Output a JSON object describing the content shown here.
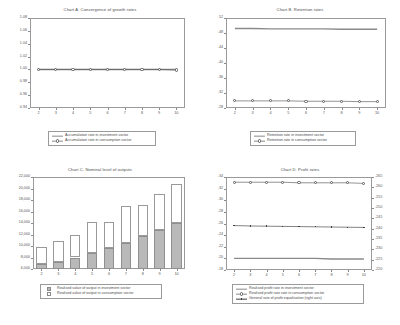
{
  "figure": {
    "panels": [
      "A",
      "B",
      "C",
      "D"
    ]
  },
  "chart_data": [
    {
      "id": "chart-a",
      "type": "line",
      "title": "Chart A. Convergence of growth rates",
      "xlabel": "",
      "ylabel": "",
      "x": [
        2,
        3,
        4,
        5,
        6,
        7,
        8,
        9,
        10
      ],
      "xticklabels": [
        "2",
        "3",
        "4",
        "5",
        "6",
        "7",
        "8",
        "9",
        "10"
      ],
      "ylim": [
        0.94,
        1.08
      ],
      "yticks": [
        1.08,
        1.06,
        1.04,
        1.02,
        1.0,
        0.98,
        0.96,
        0.94
      ],
      "yticklabels": [
        "1.08",
        "1.06",
        "1.04",
        "1.02",
        "1.00",
        "0.98",
        "0.96",
        "0.94"
      ],
      "grid": false,
      "legend_position": "below",
      "series": [
        {
          "name": "Accumulation rate in investment sector",
          "style": "line",
          "color": "#8a8a8a",
          "values": [
            1.0,
            1.0,
            1.0,
            1.0,
            1.0,
            1.0,
            1.0,
            1.0,
            1.0
          ]
        },
        {
          "name": "Accumulation rate in consumption sector",
          "style": "line-marker",
          "color": "#5a5a5a",
          "values": [
            1.0,
            1.0,
            1.0,
            1.0,
            1.0,
            1.0,
            1.0,
            1.0,
            0.999
          ]
        }
      ]
    },
    {
      "id": "chart-b",
      "type": "line",
      "title": "Chart B. Retention rates",
      "xlabel": "",
      "ylabel": "",
      "x": [
        2,
        3,
        4,
        5,
        6,
        7,
        8,
        9,
        10
      ],
      "xticklabels": [
        "2",
        "3",
        "4",
        "5",
        "6",
        "7",
        "8",
        "9",
        "10"
      ],
      "ylim": [
        0.28,
        0.52
      ],
      "yticks": [
        0.52,
        0.48,
        0.44,
        0.4,
        0.36,
        0.32,
        0.28
      ],
      "yticklabels": [
        ".52",
        ".48",
        ".44",
        ".40",
        ".36",
        ".32",
        ".28"
      ],
      "grid": false,
      "legend_position": "below",
      "series": [
        {
          "name": "Retention rate in investment sector",
          "style": "line",
          "color": "#8a8a8a",
          "values": [
            0.492,
            0.492,
            0.491,
            0.491,
            0.491,
            0.491,
            0.49,
            0.49,
            0.49
          ]
        },
        {
          "name": "Retention rate in consumption sector",
          "style": "line-marker",
          "color": "#5a5a5a",
          "values": [
            0.299,
            0.299,
            0.299,
            0.299,
            0.298,
            0.298,
            0.298,
            0.297,
            0.297
          ]
        }
      ]
    },
    {
      "id": "chart-c",
      "type": "bar",
      "title": "Chart C. Nominal level of outputs",
      "xlabel": "",
      "ylabel": "",
      "categories": [
        "2",
        "3",
        "4",
        "5",
        "6",
        "7",
        "8",
        "9",
        "10"
      ],
      "ylim": [
        6000,
        22000
      ],
      "yticks": [
        22000,
        20000,
        18000,
        16000,
        14000,
        12000,
        10000,
        8000,
        6000
      ],
      "yticklabels": [
        "22,000",
        "20,000",
        "18,000",
        "16,000",
        "14,000",
        "12,000",
        "10,000",
        "8,000",
        "6,000"
      ],
      "grid": false,
      "stacked": true,
      "legend_position": "below",
      "series": [
        {
          "name": "Realised value of output in investment sector",
          "color": "#b9b9b9",
          "values": [
            6800,
            7300,
            8000,
            8800,
            9600,
            10600,
            11700,
            12800,
            14000
          ]
        },
        {
          "name": "Realised value of output in consumption sector",
          "color": "#ffffff",
          "values": [
            2950,
            3500,
            3900,
            5400,
            4500,
            6400,
            5500,
            6200,
            6800
          ]
        }
      ]
    },
    {
      "id": "chart-d",
      "type": "line",
      "title": "Chart D. Profit rates",
      "xlabel": "",
      "ylabel": "",
      "x": [
        2,
        3,
        4,
        5,
        6,
        7,
        8,
        9,
        10
      ],
      "xticklabels": [
        "2",
        "3",
        "4",
        "5",
        "6",
        "7",
        "8",
        "9",
        "10"
      ],
      "ylim": [
        0.18,
        0.34
      ],
      "yticks": [
        0.34,
        0.32,
        0.3,
        0.28,
        0.26,
        0.24,
        0.22,
        0.2,
        0.18
      ],
      "yticklabels": [
        ".34",
        ".32",
        ".30",
        ".28",
        ".26",
        ".24",
        ".22",
        ".20",
        ".18"
      ],
      "ylim_right": [
        0.22,
        0.265
      ],
      "yticks_right": [
        0.265,
        0.26,
        0.255,
        0.25,
        0.245,
        0.24,
        0.235,
        0.23,
        0.225,
        0.22
      ],
      "yticklabels_right": [
        ".265",
        ".260",
        ".255",
        ".250",
        ".245",
        ".240",
        ".235",
        ".230",
        ".225",
        ".220"
      ],
      "grid": false,
      "legend_position": "below",
      "series": [
        {
          "name": "Realised profit rate in investment sector",
          "style": "line",
          "axis": "left",
          "color": "#8a8a8a",
          "values": [
            0.2,
            0.2,
            0.2,
            0.2,
            0.2,
            0.2,
            0.199,
            0.199,
            0.199
          ]
        },
        {
          "name": "Realised profit rate rate in consumption sector",
          "style": "line-marker",
          "axis": "left",
          "color": "#5a5a5a",
          "values": [
            0.331,
            0.331,
            0.331,
            0.331,
            0.33,
            0.33,
            0.33,
            0.33,
            0.329
          ]
        },
        {
          "name": "General rate of profit equalisation (right axis)",
          "style": "line-dot",
          "axis": "right",
          "color": "#3f3f3f",
          "values": [
            0.2415,
            0.2413,
            0.2412,
            0.2411,
            0.241,
            0.2409,
            0.2408,
            0.2407,
            0.2406
          ]
        }
      ]
    }
  ]
}
